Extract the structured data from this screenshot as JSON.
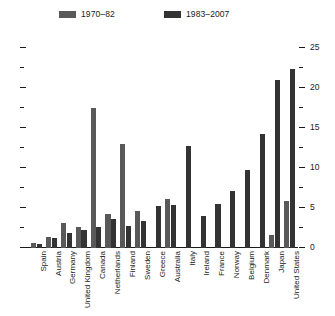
{
  "chart_data": {
    "type": "bar",
    "title": "",
    "subtitle": "",
    "xlabel": "",
    "ylabel": "",
    "ylim": [
      0,
      25
    ],
    "y_major_ticks": [
      0,
      5,
      10,
      15,
      20,
      25
    ],
    "y_minor_ticks": [
      2.5,
      7.5,
      12.5,
      17.5,
      22.5
    ],
    "y_tick_labels": [
      "0",
      "5",
      "10",
      "15",
      "20",
      "25"
    ],
    "y_axis_position": "right",
    "left_axis_ticks_labeled": false,
    "grid": false,
    "legend_position": "top",
    "categories": [
      "Spain",
      "Austria",
      "Germany",
      "United Kingdom",
      "Canada",
      "Netherlands",
      "Finland",
      "Sweden",
      "Greece",
      "Australia",
      "Italy",
      "Ireland",
      "France",
      "Norway",
      "Belgium",
      "Denmark",
      "Japan",
      "United States"
    ],
    "series": [
      {
        "name": "1970–82",
        "color": "#595959",
        "values": [
          0.6,
          1.4,
          3.1,
          2.6,
          17.5,
          4.3,
          13.0,
          4.6,
          0.0,
          6.1,
          0.0,
          0.0,
          0.0,
          0.0,
          0.0,
          0.0,
          1.6,
          5.9
        ]
      },
      {
        "name": "1983–2007",
        "color": "#333333",
        "values": [
          0.5,
          1.2,
          1.9,
          2.3,
          2.6,
          3.6,
          2.7,
          3.4,
          5.2,
          5.4,
          12.8,
          4.0,
          5.5,
          7.1,
          9.7,
          14.2,
          21.0,
          22.4
        ]
      }
    ]
  },
  "legend": {
    "entries": [
      {
        "label": "1970–82",
        "color": "#595959"
      },
      {
        "label": "1983–2007",
        "color": "#333333"
      }
    ]
  }
}
